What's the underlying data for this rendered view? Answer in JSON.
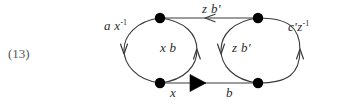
{
  "figure": {
    "equation_number": "(13)",
    "colors": {
      "background": "#ffffff",
      "stroke": "#3a3a3a",
      "node_fill": "#000000",
      "label_text": "#2b2b2b",
      "equation_text": "#555555"
    }
  },
  "labels": {
    "top_left": {
      "base": "a x",
      "sup": "-1"
    },
    "top_middle": {
      "base": "z b'",
      "sup": ""
    },
    "top_right": {
      "base": "c'z",
      "sup": "-1"
    },
    "inner_left": {
      "base": "x b",
      "sup": ""
    },
    "inner_right": {
      "base": "z b'",
      "sup": ""
    },
    "bottom_left": {
      "base": "x",
      "sup": ""
    },
    "bottom_right": {
      "base": "b",
      "sup": ""
    }
  },
  "nodes": [
    {
      "id": "top-left",
      "cx": 160,
      "cy": 18
    },
    {
      "id": "top-right",
      "cx": 258,
      "cy": 18
    },
    {
      "id": "bottom-left",
      "cx": 160,
      "cy": 83
    },
    {
      "id": "bottom-right",
      "cx": 258,
      "cy": 83
    }
  ],
  "edges": [
    {
      "id": "outer-left-arc",
      "label": "top_left",
      "direction": "downward",
      "arrow_style": "open-small"
    },
    {
      "id": "top-middle-edge",
      "label": "top_middle",
      "direction": "leftward",
      "arrow_style": "open-small"
    },
    {
      "id": "outer-right-arc",
      "label": "top_right",
      "direction": "upward",
      "arrow_style": "open-small"
    },
    {
      "id": "inner-left-arc",
      "label": "inner_left",
      "direction": "upward",
      "arrow_style": "open-small"
    },
    {
      "id": "inner-right-arc",
      "label": "inner_right",
      "direction": "downward",
      "arrow_style": "open-small"
    },
    {
      "id": "bottom-left-edge",
      "label": "bottom_left",
      "direction": "rightward",
      "arrow_style": "solid-large"
    },
    {
      "id": "bottom-right-edge",
      "label": "bottom_right",
      "direction": "rightward",
      "arrow_style": "none"
    }
  ]
}
